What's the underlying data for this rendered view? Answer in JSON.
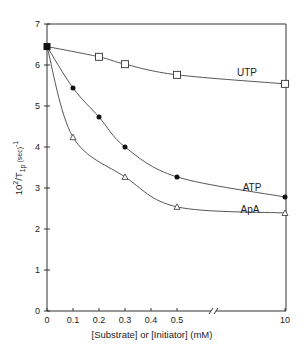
{
  "chart_data": {
    "type": "line",
    "title": "",
    "xlabel": "[Substrate] or [Initiator] (mM)",
    "ylabel": "10^2/T1p (sec)^-1",
    "ylabel_parts": {
      "base": "10",
      "exp": "2",
      "mid": "/T",
      "sub": "1p",
      "unit": " (sec)",
      "unit_exp": "-1"
    },
    "xlim": [
      0,
      10
    ],
    "ylim": [
      0,
      7
    ],
    "x_axis_break": true,
    "x_ticks": [
      "0",
      "0.1",
      "0.2",
      "0.3",
      "0.4",
      "0.5",
      "10"
    ],
    "y_ticks": [
      "0",
      "1",
      "2",
      "3",
      "4",
      "5",
      "6",
      "7"
    ],
    "grid": false,
    "legend": "inline labels",
    "series": [
      {
        "name": "UTP",
        "marker": "open-square",
        "x": [
          0,
          0.2,
          0.3,
          0.5,
          10
        ],
        "values": [
          6.45,
          6.2,
          6.02,
          5.76,
          5.54
        ]
      },
      {
        "name": "ATP",
        "marker": "filled-circle",
        "x": [
          0,
          0.1,
          0.2,
          0.3,
          0.5,
          10
        ],
        "values": [
          6.45,
          5.44,
          4.73,
          4.0,
          3.27,
          2.78
        ]
      },
      {
        "name": "ApA",
        "marker": "open-triangle",
        "x": [
          0,
          0.1,
          0.3,
          0.5,
          10
        ],
        "values": [
          6.45,
          4.24,
          3.27,
          2.54,
          2.39
        ]
      }
    ]
  }
}
